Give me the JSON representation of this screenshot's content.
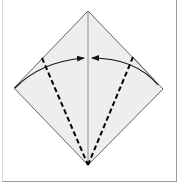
{
  "diagram": {
    "type": "origami-fold-step",
    "colors": {
      "paper_fill": "#eeeeee",
      "paper_edge": "#555555",
      "crease": "#777777",
      "valley_fold": "#000000",
      "arrow": "#111111",
      "frame": "#9a9a9a"
    },
    "paper": {
      "top": [
        88,
        11
      ],
      "right": [
        163,
        89
      ],
      "bottom": [
        88,
        165
      ],
      "left": [
        14,
        88
      ]
    },
    "center_crease": {
      "from": [
        88,
        11
      ],
      "to": [
        88,
        165
      ]
    },
    "valley_folds": [
      {
        "name": "left-valley-fold",
        "from": [
          42,
          58
        ],
        "to": [
          88,
          165
        ]
      },
      {
        "name": "right-valley-fold",
        "from": [
          133,
          57
        ],
        "to": [
          88,
          165
        ]
      }
    ],
    "arrows": [
      {
        "name": "left-fold-arrow",
        "from": [
          15,
          88
        ],
        "to": [
          84,
          58
        ],
        "direction": "right"
      },
      {
        "name": "right-fold-arrow",
        "from": [
          158,
          85
        ],
        "to": [
          92,
          58
        ],
        "direction": "left"
      }
    ]
  }
}
